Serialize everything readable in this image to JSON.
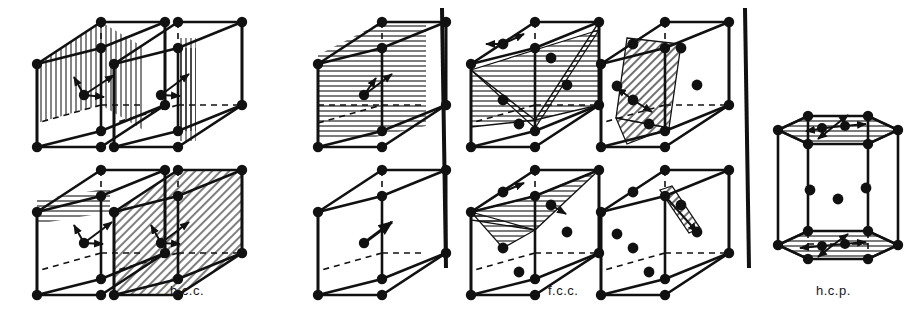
{
  "figure": {
    "background": "#ffffff",
    "ink": "#111111",
    "groups": [
      {
        "id": "bcc",
        "label": "b.c.c.",
        "label_x": 196,
        "label_y": 292,
        "cells": 6,
        "slip_direction": "[111]",
        "slip_planes": [
          "(110)",
          "(110)",
          "(112)",
          "(112)",
          "(123)",
          "[111] direction only"
        ]
      },
      {
        "id": "fcc",
        "label": "f.c.c.",
        "label_x": 571,
        "label_y": 292,
        "cells": 4,
        "slip_direction": "[110]",
        "slip_planes": [
          "(111)",
          "(111)",
          "(111)",
          "(111)"
        ]
      },
      {
        "id": "hcp",
        "label": "h.c.p.",
        "label_x": 841,
        "label_y": 292,
        "cells": 1,
        "slip_direction": "[1120]",
        "slip_planes": [
          "(0001) basal"
        ]
      }
    ],
    "dividers": [
      {
        "name": "divider-bcc-fcc",
        "x": 442,
        "y1": 8,
        "y2": 268
      },
      {
        "name": "divider-fcc-hcp",
        "x": 745,
        "y1": 8,
        "y2": 268
      }
    ],
    "atom_color": "#111111",
    "atom_radius": 5.2,
    "hatch_color": "#111111"
  }
}
